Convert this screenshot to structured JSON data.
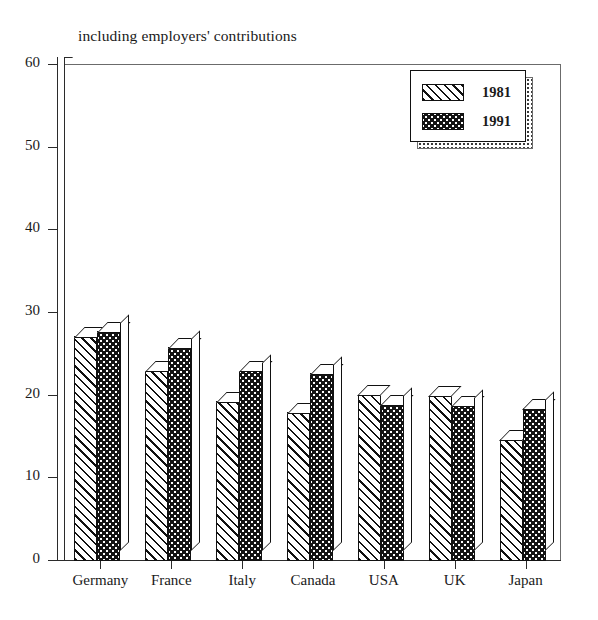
{
  "chart_data": {
    "type": "bar",
    "title": "including employers' contributions",
    "xlabel": "",
    "ylabel": "",
    "ylim": [
      0,
      60
    ],
    "yticks": [
      0,
      10,
      20,
      30,
      40,
      50,
      60
    ],
    "grid": false,
    "legend_position": "top-right",
    "categories": [
      "Germany",
      "France",
      "Italy",
      "Canada",
      "USA",
      "UK",
      "Japan"
    ],
    "series": [
      {
        "name": "1981",
        "values": [
          27.2,
          23.0,
          19.3,
          18.0,
          20.1,
          20.0,
          14.7
        ]
      },
      {
        "name": "1991",
        "values": [
          27.8,
          25.9,
          23.0,
          22.7,
          19.0,
          18.8,
          18.5
        ]
      }
    ]
  },
  "legend": {
    "entries": [
      {
        "label": "1981",
        "pattern": "diagonal-hatch"
      },
      {
        "label": "1991",
        "pattern": "dark-dotted"
      }
    ]
  },
  "colors": {
    "axis": "#2b2b2b",
    "frame": "#6b6b6b",
    "bar_1981_fill": "#ffffff",
    "bar_1991_fill": "#141414",
    "background": "#ffffff"
  }
}
